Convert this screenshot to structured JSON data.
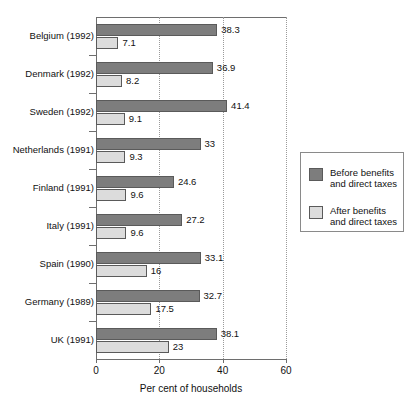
{
  "chart_data": {
    "type": "bar",
    "orientation": "horizontal",
    "title": "",
    "xlabel": "Per cent of households",
    "ylabel": "",
    "xlim": [
      0,
      60
    ],
    "xticks": [
      0,
      20,
      40,
      60
    ],
    "xticklabels": [
      "0",
      "20",
      "40",
      "60"
    ],
    "grid": "vertical-dotted",
    "legend_position": "right",
    "categories": [
      "Belgium (1992)",
      "Denmark (1992)",
      "Sweden (1992)",
      "Netherlands (1991)",
      "Finland (1991)",
      "Italy (1991)",
      "Spain (1990)",
      "Germany (1989)",
      "UK (1991)"
    ],
    "series": [
      {
        "name": "Before benefits\nand direct taxes",
        "color": "#7d7d7d",
        "values": [
          38.3,
          36.9,
          41.4,
          33,
          24.6,
          27.2,
          33.1,
          32.7,
          38.1
        ],
        "labels": [
          "38.3",
          "36.9",
          "41.4",
          "33",
          "24.6",
          "27.2",
          "33.1",
          "32.7",
          "38.1"
        ]
      },
      {
        "name": "After benefits\nand direct taxes",
        "color": "#dcdcdc",
        "values": [
          7.1,
          8.2,
          9.1,
          9.3,
          9.6,
          9.6,
          16,
          17.5,
          23
        ],
        "labels": [
          "7.1",
          "8.2",
          "9.1",
          "9.3",
          "9.6",
          "9.6",
          "16",
          "17.5",
          "23"
        ]
      }
    ]
  },
  "legend": {
    "items": [
      {
        "label": "Before benefits\nand direct taxes",
        "swatch": "before"
      },
      {
        "label": "After benefits\nand direct taxes",
        "swatch": "after"
      }
    ]
  },
  "axis": {
    "x_title": "Per cent of households"
  }
}
